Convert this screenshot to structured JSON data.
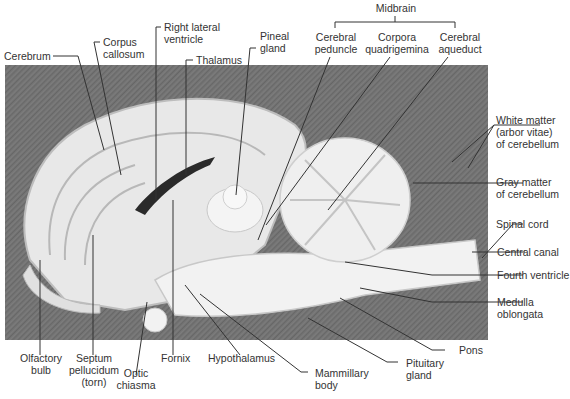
{
  "figure": {
    "group_label": "Midbrain",
    "labels": {
      "cerebrum": "Cerebrum",
      "corpus_callosum": [
        "Corpus",
        "callosum"
      ],
      "right_lateral_ventricle": [
        "Right lateral",
        "ventricle"
      ],
      "thalamus": "Thalamus",
      "pineal_gland": [
        "Pineal",
        "gland"
      ],
      "cerebral_peduncle": [
        "Cerebral",
        "peduncle"
      ],
      "corpora_quadrigemina": [
        "Corpora",
        "quadrigemina"
      ],
      "cerebral_aqueduct": [
        "Cerebral",
        "aqueduct"
      ],
      "white_matter": [
        "White matter",
        "(arbor vitae)",
        "of cerebellum"
      ],
      "gray_matter": [
        "Gray matter",
        "of cerebellum"
      ],
      "spinal_cord": "Spinal cord",
      "central_canal": "Central canal",
      "fourth_ventricle": "Fourth ventricle",
      "medulla_oblongata": [
        "Medulla",
        "oblongata"
      ],
      "pons": "Pons",
      "pituitary_gland": [
        "Pituitary",
        "gland"
      ],
      "mammillary_body": [
        "Mammillary",
        "body"
      ],
      "hypothalamus": "Hypothalamus",
      "fornix": "Fornix",
      "optic_chiasma": [
        "Optic",
        "chiasma"
      ],
      "septum_pellucidum": [
        "Septum",
        "pellucidum",
        "(torn)"
      ],
      "olfactory_bulb": [
        "Olfactory",
        "bulb"
      ]
    },
    "colors": {
      "background": "#ffffff",
      "photo_backdrop": "#707070",
      "tissue": "#ececec",
      "leader_line": "#333333",
      "label_text": "#333333"
    }
  }
}
